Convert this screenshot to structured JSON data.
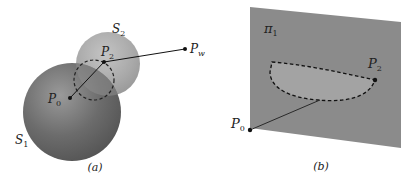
{
  "figure_a": {
    "caption": "(a)",
    "labels": {
      "sphere_large": "S",
      "sphere_large_sub": "1",
      "sphere_small": "S",
      "sphere_small_sub": "2",
      "point_p0": "P",
      "point_p0_sub": "0",
      "point_p2": "P",
      "point_p2_sub": "2",
      "point_pw": "P",
      "point_pw_sub": "w"
    },
    "colors": {
      "sphere_large": "#6e6e6e",
      "sphere_small": "#a8a8a8",
      "line": "#111111"
    }
  },
  "figure_b": {
    "caption": "(b)",
    "labels": {
      "plane": "π",
      "plane_sub": "1",
      "point_p2": "P",
      "point_p2_sub": "2",
      "point_p0": "P",
      "point_p0_sub": "0"
    },
    "colors": {
      "plane": "#8a8a8a",
      "region": "#a2a2a2",
      "line": "#111111"
    }
  }
}
